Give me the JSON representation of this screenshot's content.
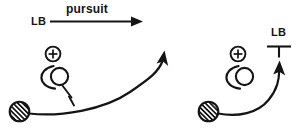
{
  "figure": {
    "width": 307,
    "height": 131,
    "background_color": "#ffffff",
    "ink_color": "#141414"
  },
  "header": {
    "condition_label": "LB",
    "condition_name": "pursuit",
    "arrow_icon": "right-arrow-icon"
  },
  "panels": [
    {
      "id": "left",
      "name": "pursuit-panel-left",
      "fixation_symbol": "circled-plus-icon",
      "observer_symbol": "observer-head-icon",
      "ball_symbol": "hatched-ball-icon",
      "trajectory_symbol": "curved-trajectory-arrow-icon",
      "has_gaze_pointer": true,
      "gaze_pointer_symbol": "gaze-pointer-tick-icon",
      "has_target_marker": false,
      "target_marker_label": "",
      "target_marker_symbol": ""
    },
    {
      "id": "right",
      "name": "pursuit-panel-right",
      "fixation_symbol": "circled-plus-icon",
      "observer_symbol": "observer-head-icon",
      "ball_symbol": "hatched-ball-icon",
      "trajectory_symbol": "curved-trajectory-arrow-icon",
      "has_gaze_pointer": false,
      "gaze_pointer_symbol": "",
      "has_target_marker": true,
      "target_marker_label": "LB",
      "target_marker_symbol": "perpendicular-tee-icon"
    }
  ]
}
